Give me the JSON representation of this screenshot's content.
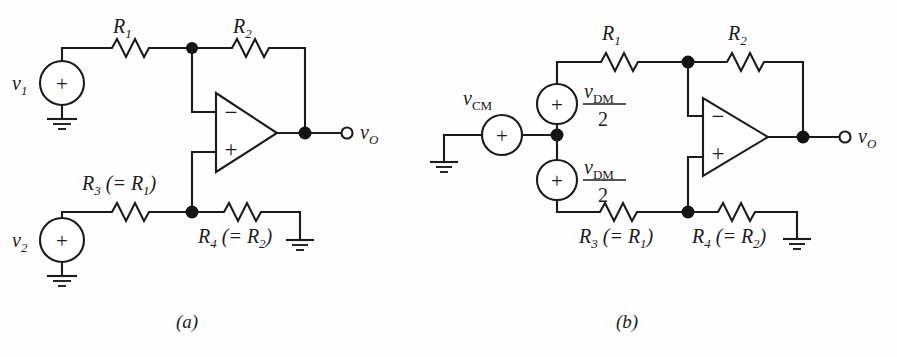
{
  "figure": {
    "kind": "circuit-diagram",
    "background_color": "#fefefe",
    "ink_color": "#1b1b1b",
    "width": 897,
    "height": 357
  },
  "captions": {
    "a": "(a)",
    "b": "(b)"
  },
  "circuit_a": {
    "title_caption": "(a)",
    "sources": [
      {
        "name": "v1",
        "label_base": "v",
        "label_sub": "1",
        "polarity": "+"
      },
      {
        "name": "v2",
        "label_base": "v",
        "label_sub": "2",
        "polarity": "+"
      }
    ],
    "resistors": [
      {
        "name": "R1",
        "label_base": "R",
        "label_sub": "1",
        "note": ""
      },
      {
        "name": "R2",
        "label_base": "R",
        "label_sub": "2",
        "note": ""
      },
      {
        "name": "R3",
        "label_base": "R",
        "label_sub": "3",
        "note": " (= R1)",
        "note_base": " (= R",
        "note_sub": "1",
        "note_tail": ")"
      },
      {
        "name": "R4",
        "label_base": "R",
        "label_sub": "4",
        "note": " (= R2)",
        "note_base": " (= R",
        "note_sub": "2",
        "note_tail": ")"
      }
    ],
    "opamp": {
      "inverting_sign": "−",
      "noninverting_sign": "+"
    },
    "output": {
      "label_base": "v",
      "label_sub": "O"
    },
    "grounds": 3
  },
  "circuit_b": {
    "title_caption": "(b)",
    "sources": [
      {
        "name": "vCM",
        "label_base": "v",
        "label_sub": "CM",
        "polarity": "+"
      },
      {
        "name": "vDM_over_2_top",
        "numerator_base": "v",
        "numerator_sub": "DM",
        "denominator": "2",
        "polarity": "+"
      },
      {
        "name": "vDM_over_2_bottom",
        "numerator_base": "v",
        "numerator_sub": "DM",
        "denominator": "2",
        "polarity": "+"
      }
    ],
    "resistors": [
      {
        "name": "R1",
        "label_base": "R",
        "label_sub": "1",
        "note": ""
      },
      {
        "name": "R2",
        "label_base": "R",
        "label_sub": "2",
        "note": ""
      },
      {
        "name": "R3",
        "label_base": "R",
        "label_sub": "3",
        "note_base": " (= R",
        "note_sub": "1",
        "note_tail": ")"
      },
      {
        "name": "R4",
        "label_base": "R",
        "label_sub": "4",
        "note_base": " (= R",
        "note_sub": "2",
        "note_tail": ")"
      }
    ],
    "opamp": {
      "inverting_sign": "−",
      "noninverting_sign": "+"
    },
    "output": {
      "label_base": "v",
      "label_sub": "O"
    },
    "grounds": 2
  }
}
